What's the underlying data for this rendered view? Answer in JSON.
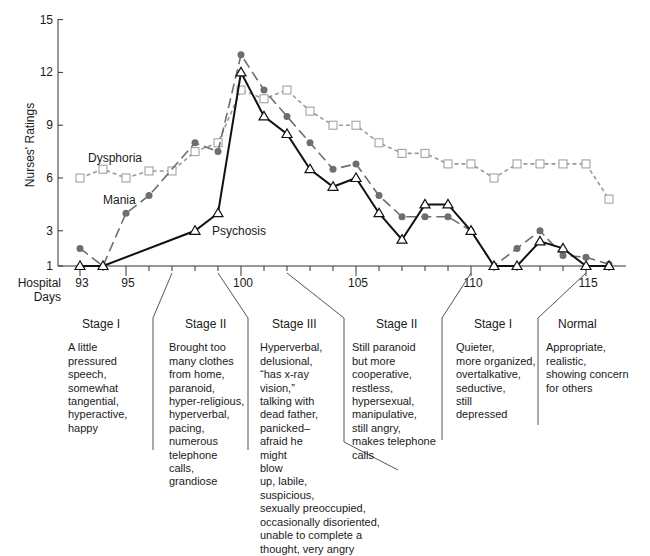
{
  "chart_data": {
    "type": "line",
    "title": "",
    "xlabel": "Hospital Days",
    "ylabel": "Nurses' Ratings",
    "ylim": [
      1,
      15
    ],
    "xlim": [
      93,
      117
    ],
    "y_ticks": [
      1,
      3,
      6,
      9,
      12,
      15
    ],
    "x_tick_labels": [
      93,
      95,
      100,
      105,
      110,
      115
    ],
    "x": [
      93,
      94,
      95,
      96,
      97,
      98,
      99,
      100,
      101,
      102,
      103,
      104,
      105,
      106,
      107,
      108,
      109,
      110,
      111,
      112,
      113,
      114,
      115,
      116
    ],
    "grid": false,
    "legend": "inline labels",
    "series": [
      {
        "name": "Dysphoria",
        "marker": "open-square",
        "line_style": "short-dash",
        "color": "#9a9a9a",
        "points": [
          [
            93,
            6
          ],
          [
            94,
            6.5
          ],
          [
            95,
            6
          ],
          [
            96,
            6.4
          ],
          [
            97,
            6.4
          ],
          [
            98,
            7.5
          ],
          [
            99,
            8
          ],
          [
            100,
            11
          ],
          [
            101,
            10.5
          ],
          [
            102,
            11
          ],
          [
            103,
            9.8
          ],
          [
            104,
            9
          ],
          [
            105,
            9
          ],
          [
            106,
            8
          ],
          [
            107,
            7.4
          ],
          [
            108,
            7.4
          ],
          [
            109,
            6.8
          ],
          [
            110,
            6.8
          ],
          [
            111,
            6
          ],
          [
            112,
            6.8
          ],
          [
            113,
            6.8
          ],
          [
            114,
            6.8
          ],
          [
            115,
            6.8
          ],
          [
            116,
            4.8
          ]
        ]
      },
      {
        "name": "Mania",
        "marker": "filled-circle",
        "line_style": "long-dash",
        "color": "#6e6e6e",
        "points": [
          [
            93,
            2
          ],
          [
            94,
            1
          ],
          [
            95,
            4
          ],
          [
            96,
            5
          ],
          [
            98,
            8
          ],
          [
            99,
            7.5
          ],
          [
            100,
            13
          ],
          [
            101,
            11
          ],
          [
            102,
            9.5
          ],
          [
            103,
            8
          ],
          [
            104,
            6.5
          ],
          [
            105,
            6.8
          ],
          [
            106,
            5
          ],
          [
            107,
            3.8
          ],
          [
            108,
            3.8
          ],
          [
            109,
            3.8
          ],
          [
            110,
            3
          ],
          [
            111,
            1
          ],
          [
            112,
            2
          ],
          [
            113,
            3
          ],
          [
            114,
            1.6
          ],
          [
            115,
            1.5
          ],
          [
            116,
            1.1
          ]
        ]
      },
      {
        "name": "Psychosis",
        "marker": "open-triangle",
        "line_style": "solid",
        "color": "#111111",
        "points": [
          [
            93,
            1
          ],
          [
            94,
            1
          ],
          [
            98,
            3
          ],
          [
            99,
            4
          ],
          [
            100,
            12
          ],
          [
            101,
            9.5
          ],
          [
            102,
            8.5
          ],
          [
            103,
            6.5
          ],
          [
            104,
            5.5
          ],
          [
            105,
            6
          ],
          [
            106,
            4
          ],
          [
            107,
            2.5
          ],
          [
            108,
            4.5
          ],
          [
            109,
            4.5
          ],
          [
            110,
            3
          ],
          [
            111,
            1
          ],
          [
            112,
            1
          ],
          [
            113,
            2.4
          ],
          [
            114,
            2
          ],
          [
            115,
            1
          ],
          [
            116,
            1
          ]
        ]
      }
    ],
    "series_labels": [
      {
        "name": "Dysphoria",
        "x": 95.2,
        "y": 7.3
      },
      {
        "name": "Mania",
        "x": 96.0,
        "y": 4.8
      },
      {
        "name": "Psychosis",
        "x": 99.4,
        "y": 2.9
      }
    ],
    "annotations": [
      {
        "stage": "Stage I",
        "days": "93-97"
      },
      {
        "stage": "Stage II",
        "days": "97-99"
      },
      {
        "stage": "Stage III",
        "days": "99-102"
      },
      {
        "stage": "Stage II",
        "days": "102-110"
      },
      {
        "stage": "Stage I",
        "days": "110-115"
      },
      {
        "stage": "Normal",
        "days": "115-"
      }
    ]
  },
  "axes": {
    "y_title": "Nurses' Ratings",
    "x_title_line1": "Hospital",
    "x_title_line2": "Days"
  },
  "stages": [
    {
      "title": "Stage I",
      "desc": "A little\npressured\nspeech,\nsomewhat\ntangential,\nhyperactive,\nhappy"
    },
    {
      "title": "Stage II",
      "desc": "Brought too\nmany clothes\nfrom home,\nparanoid,\nhyper-religious,\nhyperverbal,\npacing,\nnumerous\ntelephone\ncalls,\ngrandiose"
    },
    {
      "title": "Stage III",
      "desc": "Hyperverbal,\ndelusional,\n“has x-ray\nvision,”\ntalking with\ndead father,\npanicked–\nafraid he\nmight\nblow\nup, labile,\nsuspicious,\nsexually preoccupied,\noccasionally disoriented,\nunable to complete a\nthought, very angry"
    },
    {
      "title": "Stage II",
      "desc": "Still paranoid\nbut more cooperative,\nrestless,\nhypersexual,\nmanipulative,\nstill angry,\nmakes telephone\ncalls"
    },
    {
      "title": "Stage I",
      "desc": "Quieter,\nmore organized,\novertalkative,\nseductive,\nstill\ndepressed"
    },
    {
      "title": "Normal",
      "desc": "Appropriate,\nrealistic,\nshowing concern\nfor others"
    }
  ]
}
